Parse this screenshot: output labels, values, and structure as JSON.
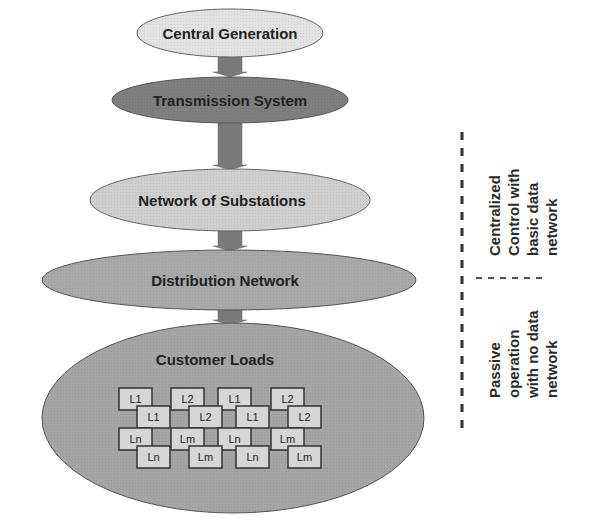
{
  "diagram": {
    "layers": [
      {
        "id": "central-generation",
        "label": "Central Generation",
        "fill": "#e2e2e2"
      },
      {
        "id": "transmission-system",
        "label": "Transmission System",
        "fill": "#7f7f7f"
      },
      {
        "id": "network-of-substations",
        "label": "Network of Substations",
        "fill": "#cfcfcf"
      },
      {
        "id": "distribution-network",
        "label": "Distribution Network",
        "fill": "#a9a9a9"
      },
      {
        "id": "customer-loads",
        "label": "Customer Loads",
        "fill": "#a5a5a5"
      }
    ],
    "arrow_color": "#7a7a7a",
    "loads": {
      "front_row_1": [
        "L1",
        "L2",
        "L1",
        "L2"
      ],
      "back_row_1": [
        "L1",
        "L2",
        "L1",
        "L2"
      ],
      "front_row_2": [
        "Ln",
        "Lm",
        "Ln",
        "Lm"
      ],
      "back_row_2": [
        "Ln",
        "Lm",
        "Ln",
        "Lm"
      ]
    },
    "side_labels": {
      "upper": [
        "Centralized",
        "Control with",
        "basic data",
        "network"
      ],
      "lower": [
        "Passive",
        "operation",
        "with no data",
        "network"
      ]
    }
  }
}
